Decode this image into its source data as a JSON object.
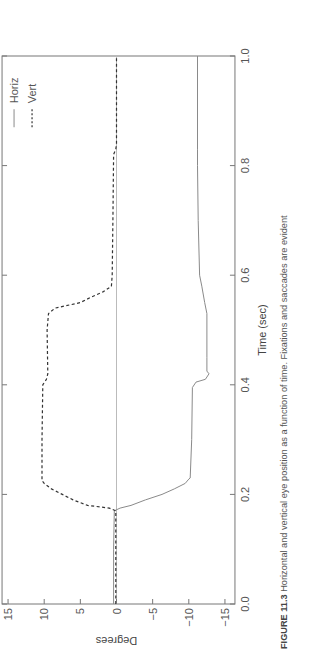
{
  "chart_data": {
    "type": "line",
    "title": "",
    "xlabel": "Time (sec)",
    "ylabel": "Degrees",
    "xlim": [
      0.0,
      1.0
    ],
    "ylim": [
      -15,
      15
    ],
    "xticks": [
      "0.0",
      "0.2",
      "0.4",
      "0.6",
      "0.8",
      "1.0"
    ],
    "yticks": [
      "15",
      "10",
      "5",
      "0",
      "−5",
      "−10",
      "−15"
    ],
    "grid": false,
    "zero_line": true,
    "legend_position": "upper right",
    "orientation": "rotated 90° counter-clockwise on page",
    "series": [
      {
        "name": "Horiz",
        "style": "solid",
        "color": "#8a8a8a",
        "x": [
          0.0,
          0.1,
          0.17,
          0.175,
          0.18,
          0.19,
          0.2,
          0.21,
          0.22,
          0.228,
          0.23,
          0.3,
          0.395,
          0.405,
          0.41,
          0.42,
          0.425,
          0.45,
          0.53,
          0.55,
          0.58,
          0.6,
          0.7,
          0.8,
          0.83,
          1.0
        ],
        "y": [
          0.4,
          0.4,
          0.3,
          -0.5,
          -2,
          -4,
          -6.3,
          -8,
          -9.5,
          -10,
          -10.2,
          -10.4,
          -10.5,
          -11,
          -12.3,
          -12.8,
          -12.5,
          -12.5,
          -12.5,
          -12.2,
          -11.8,
          -11.5,
          -11.3,
          -11.2,
          -11.2,
          -11.2
        ]
      },
      {
        "name": "Vert",
        "style": "dashed",
        "color": "#333333",
        "x": [
          0.0,
          0.17,
          0.175,
          0.18,
          0.19,
          0.2,
          0.21,
          0.22,
          0.225,
          0.3,
          0.4,
          0.41,
          0.42,
          0.5,
          0.53,
          0.54,
          0.55,
          0.56,
          0.57,
          0.58,
          0.6,
          0.7,
          0.82,
          0.83,
          0.84,
          1.0
        ],
        "y": [
          0.1,
          0.1,
          1,
          4,
          6,
          7.5,
          9,
          10,
          10.3,
          10.3,
          10.2,
          9.7,
          9.5,
          9.6,
          9.4,
          8.5,
          5,
          3.5,
          1.8,
          0.7,
          0.6,
          0.5,
          0.4,
          0.1,
          0.0,
          0.0
        ]
      }
    ]
  },
  "legend": {
    "items": [
      {
        "label": "Horiz",
        "style": "solid"
      },
      {
        "label": "Vert",
        "style": "dashed"
      }
    ]
  },
  "axes": {
    "xlabel": "Time (sec)",
    "ylabel": "Degrees"
  },
  "caption": {
    "figure_label": "FIGURE 11.3",
    "text": "Horizontal and vertical eye position as a function of time. Fixations and saccades are evident"
  },
  "colors": {
    "frame": "#777777",
    "horiz": "#8a8a8a",
    "vert": "#333333",
    "zero_line": "#bbbbbb"
  }
}
